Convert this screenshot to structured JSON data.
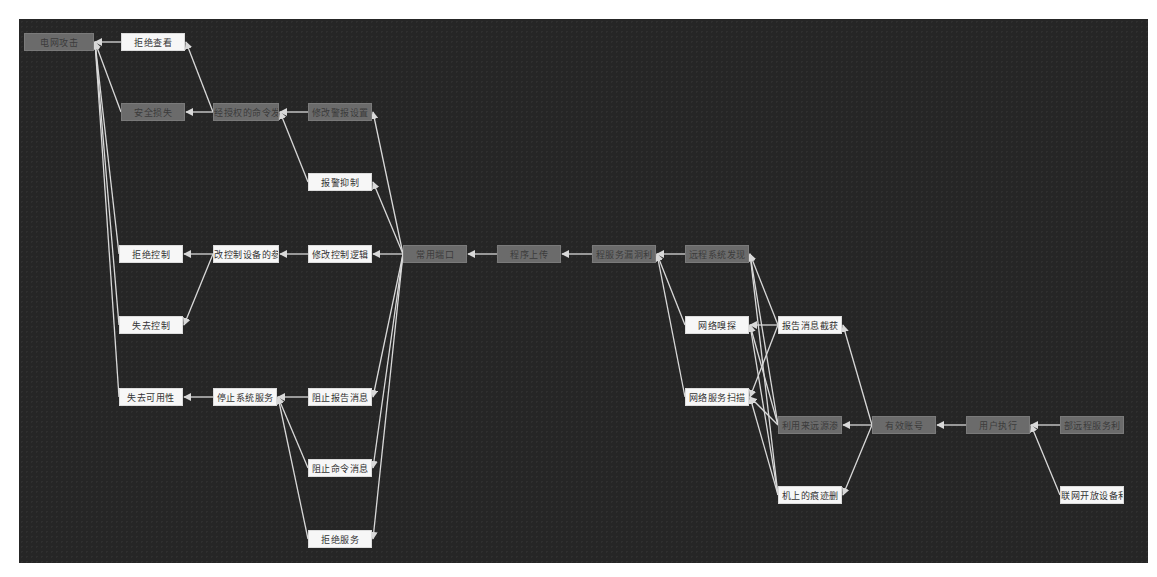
{
  "diagram": {
    "title": "",
    "background": "#262626",
    "edge_color": "#d9d9d9",
    "node_colors": {
      "dark": "#6b6b6b",
      "light": "#f7f7f7"
    },
    "nodes": [
      {
        "id": "n0",
        "label": "电网攻击",
        "x": 24,
        "y": 33,
        "w": 70,
        "variant": "dark"
      },
      {
        "id": "n1",
        "label": "拒绝查看",
        "x": 121,
        "y": 33,
        "w": 64,
        "variant": "light"
      },
      {
        "id": "n2",
        "label": "安全损失",
        "x": 121,
        "y": 103,
        "w": 64,
        "variant": "dark"
      },
      {
        "id": "n3",
        "label": "经授权的命令发",
        "x": 213,
        "y": 103,
        "w": 66,
        "variant": "dark"
      },
      {
        "id": "n4",
        "label": "修改警报设置",
        "x": 308,
        "y": 103,
        "w": 64,
        "variant": "dark"
      },
      {
        "id": "n5",
        "label": "报警抑制",
        "x": 308,
        "y": 173,
        "w": 64,
        "variant": "light"
      },
      {
        "id": "n6",
        "label": "拒绝控制",
        "x": 119,
        "y": 245,
        "w": 64,
        "variant": "light"
      },
      {
        "id": "n7",
        "label": "改控制设备的参",
        "x": 213,
        "y": 245,
        "w": 66,
        "variant": "light"
      },
      {
        "id": "n8",
        "label": "修改控制逻辑",
        "x": 308,
        "y": 245,
        "w": 64,
        "variant": "light"
      },
      {
        "id": "n9",
        "label": "常用端口",
        "x": 403,
        "y": 245,
        "w": 64,
        "variant": "dark"
      },
      {
        "id": "n10",
        "label": "程序上传",
        "x": 497,
        "y": 245,
        "w": 64,
        "variant": "dark"
      },
      {
        "id": "n11",
        "label": "程服务漏洞利",
        "x": 592,
        "y": 245,
        "w": 64,
        "variant": "dark"
      },
      {
        "id": "n12",
        "label": "远程系统发现",
        "x": 685,
        "y": 245,
        "w": 64,
        "variant": "dark"
      },
      {
        "id": "n13",
        "label": "失去控制",
        "x": 119,
        "y": 316,
        "w": 64,
        "variant": "light"
      },
      {
        "id": "n14",
        "label": "网络嗅探",
        "x": 685,
        "y": 316,
        "w": 64,
        "variant": "light"
      },
      {
        "id": "n15",
        "label": "报告消息截获",
        "x": 778,
        "y": 316,
        "w": 64,
        "variant": "light"
      },
      {
        "id": "n16",
        "label": "失去可用性",
        "x": 119,
        "y": 388,
        "w": 64,
        "variant": "light"
      },
      {
        "id": "n17",
        "label": "停止系统服务",
        "x": 213,
        "y": 388,
        "w": 64,
        "variant": "light"
      },
      {
        "id": "n18",
        "label": "阻止报告消息",
        "x": 308,
        "y": 388,
        "w": 64,
        "variant": "light"
      },
      {
        "id": "n19",
        "label": "网络服务扫描",
        "x": 685,
        "y": 388,
        "w": 64,
        "variant": "light"
      },
      {
        "id": "n20",
        "label": "利用来远源渗",
        "x": 778,
        "y": 416,
        "w": 64,
        "variant": "dark"
      },
      {
        "id": "n21",
        "label": "有效账号",
        "x": 872,
        "y": 416,
        "w": 64,
        "variant": "dark"
      },
      {
        "id": "n22",
        "label": "用户执行",
        "x": 966,
        "y": 416,
        "w": 64,
        "variant": "dark"
      },
      {
        "id": "n23",
        "label": "部远程服务利",
        "x": 1060,
        "y": 416,
        "w": 64,
        "variant": "dark"
      },
      {
        "id": "n24",
        "label": "阻止命令消息",
        "x": 308,
        "y": 459,
        "w": 64,
        "variant": "light"
      },
      {
        "id": "n25",
        "label": "机上的痕迹删",
        "x": 778,
        "y": 486,
        "w": 64,
        "variant": "light"
      },
      {
        "id": "n26",
        "label": "联网开放设备利",
        "x": 1060,
        "y": 486,
        "w": 64,
        "variant": "light"
      },
      {
        "id": "n27",
        "label": "拒绝服务",
        "x": 308,
        "y": 530,
        "w": 64,
        "variant": "light"
      }
    ],
    "edges": [
      [
        "n1",
        "n0"
      ],
      [
        "n2",
        "n0"
      ],
      [
        "n6",
        "n0"
      ],
      [
        "n13",
        "n0"
      ],
      [
        "n16",
        "n0"
      ],
      [
        "n3",
        "n1"
      ],
      [
        "n3",
        "n2"
      ],
      [
        "n7",
        "n6"
      ],
      [
        "n7",
        "n13"
      ],
      [
        "n17",
        "n16"
      ],
      [
        "n4",
        "n3"
      ],
      [
        "n5",
        "n3"
      ],
      [
        "n8",
        "n7"
      ],
      [
        "n18",
        "n17"
      ],
      [
        "n24",
        "n17"
      ],
      [
        "n27",
        "n17"
      ],
      [
        "n9",
        "n4"
      ],
      [
        "n9",
        "n5"
      ],
      [
        "n9",
        "n8"
      ],
      [
        "n9",
        "n18"
      ],
      [
        "n9",
        "n24"
      ],
      [
        "n9",
        "n27"
      ],
      [
        "n10",
        "n9"
      ],
      [
        "n11",
        "n10"
      ],
      [
        "n12",
        "n11"
      ],
      [
        "n14",
        "n11"
      ],
      [
        "n19",
        "n11"
      ],
      [
        "n15",
        "n12"
      ],
      [
        "n20",
        "n12"
      ],
      [
        "n25",
        "n12"
      ],
      [
        "n15",
        "n14"
      ],
      [
        "n20",
        "n14"
      ],
      [
        "n25",
        "n14"
      ],
      [
        "n15",
        "n19"
      ],
      [
        "n20",
        "n19"
      ],
      [
        "n25",
        "n19"
      ],
      [
        "n21",
        "n15"
      ],
      [
        "n21",
        "n20"
      ],
      [
        "n21",
        "n25"
      ],
      [
        "n22",
        "n21"
      ],
      [
        "n23",
        "n22"
      ],
      [
        "n26",
        "n22"
      ]
    ]
  }
}
